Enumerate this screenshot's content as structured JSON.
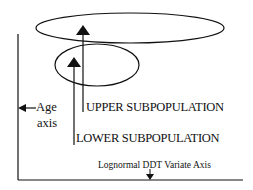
{
  "diagram": {
    "labels": {
      "age_axis_line1": "Age",
      "age_axis_line2": "axis",
      "upper": "UPPER SUBPOPULATION",
      "lower": "LOWER SUBPOPULATION",
      "x_axis": "Lognormal DDT Variate Axis"
    },
    "shapes": {
      "upper_ellipse": {
        "cx": 130,
        "cy": 28,
        "rx": 94,
        "ry": 15
      },
      "lower_ellipse": {
        "cx": 97,
        "cy": 65,
        "rx": 42,
        "ry": 21
      }
    },
    "colors": {
      "stroke": "#111111",
      "background": "#ffffff"
    }
  }
}
